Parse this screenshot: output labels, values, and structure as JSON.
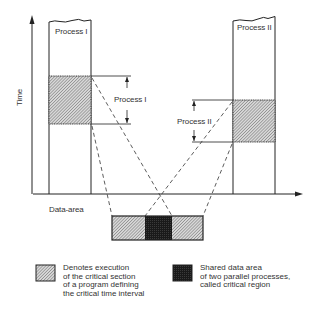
{
  "diagram": {
    "axis": {
      "y_label": "Time"
    },
    "process_1": {
      "column_label": "Process I",
      "dimension_label": "Process I"
    },
    "process_2": {
      "column_label": "Process II",
      "dimension_label": "Process II"
    },
    "data_area_label": "Data-area",
    "legend": [
      {
        "swatch": "hatched",
        "lines": [
          "Denotes execution",
          "of the critical section",
          "of a program defining",
          "the critical time interval"
        ]
      },
      {
        "swatch": "solid-dark",
        "lines": [
          "Shared data area",
          "of two parallel processes,",
          "called critical region"
        ]
      }
    ],
    "colors": {
      "line": "#222222",
      "hatch_fill": "#cfcfcf",
      "critical_region": "#1a1a1a",
      "background": "#ffffff"
    }
  }
}
